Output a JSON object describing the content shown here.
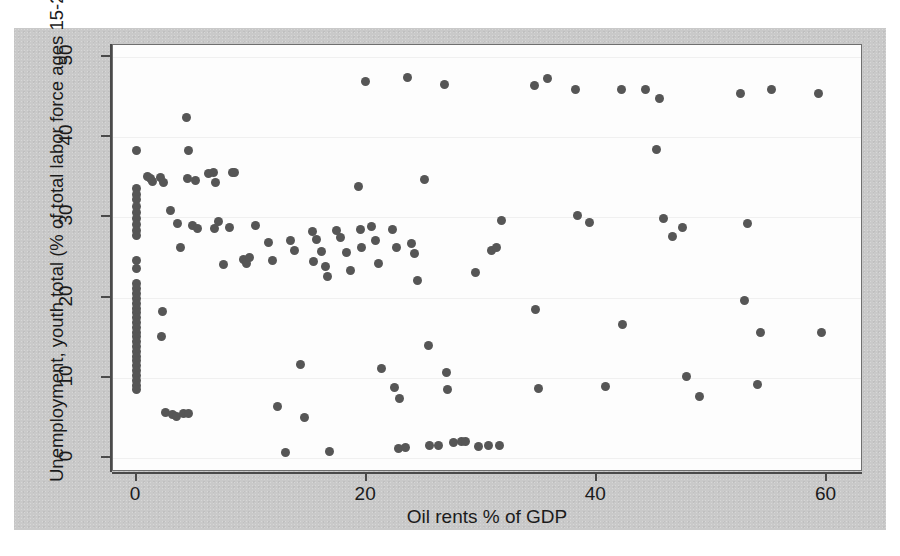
{
  "figure": {
    "background_color": "#c9c9c9",
    "plot_background_color": "#fdfdfd",
    "marker_color": "#565656"
  },
  "chart_data": {
    "type": "scatter",
    "title": "",
    "xlabel": "Oil rents % of GDP",
    "ylabel": "Unemployment, youth total (% of total labor force ages 15-24)",
    "xlim": [
      -2,
      63
    ],
    "ylim": [
      -1.5,
      51.5
    ],
    "xticks": [
      0,
      20,
      40,
      60
    ],
    "yticks": [
      0,
      10,
      20,
      30,
      40,
      50
    ],
    "xtick_labels": [
      "0",
      "20",
      "40",
      "60"
    ],
    "ytick_labels": [
      "0",
      "10",
      "20",
      "30",
      "40",
      "50"
    ],
    "grid": "faint horizontal",
    "legend": "none",
    "marker": "filled circle",
    "points": [
      [
        0.0,
        38.4
      ],
      [
        0.0,
        33.6
      ],
      [
        0.0,
        32.9
      ],
      [
        0.0,
        32.2
      ],
      [
        0.0,
        31.4
      ],
      [
        0.0,
        30.6
      ],
      [
        0.0,
        29.9
      ],
      [
        0.0,
        29.1
      ],
      [
        0.0,
        28.4
      ],
      [
        0.0,
        27.8
      ],
      [
        0.0,
        24.6
      ],
      [
        0.0,
        23.6
      ],
      [
        0.0,
        21.7
      ],
      [
        0.0,
        21.1
      ],
      [
        0.0,
        20.5
      ],
      [
        0.0,
        19.9
      ],
      [
        0.0,
        19.3
      ],
      [
        0.0,
        18.7
      ],
      [
        0.0,
        18.1
      ],
      [
        0.0,
        17.5
      ],
      [
        0.0,
        16.9
      ],
      [
        0.0,
        16.3
      ],
      [
        0.0,
        15.7
      ],
      [
        0.0,
        15.1
      ],
      [
        0.0,
        14.5
      ],
      [
        0.0,
        13.9
      ],
      [
        0.0,
        13.3
      ],
      [
        0.0,
        12.7
      ],
      [
        0.0,
        12.1
      ],
      [
        0.0,
        11.5
      ],
      [
        0.0,
        10.9
      ],
      [
        0.0,
        10.3
      ],
      [
        0.0,
        9.7
      ],
      [
        0.0,
        9.1
      ],
      [
        0.0,
        8.6
      ],
      [
        1.0,
        35.1
      ],
      [
        1.3,
        34.8
      ],
      [
        1.4,
        34.5
      ],
      [
        2.1,
        35.0
      ],
      [
        2.4,
        34.4
      ],
      [
        2.3,
        18.3
      ],
      [
        2.2,
        15.1
      ],
      [
        2.6,
        5.7
      ],
      [
        3.2,
        5.4
      ],
      [
        3.5,
        5.2
      ],
      [
        4.1,
        5.5
      ],
      [
        4.6,
        5.5
      ],
      [
        3.0,
        30.9
      ],
      [
        3.6,
        29.3
      ],
      [
        3.9,
        26.2
      ],
      [
        4.4,
        42.5
      ],
      [
        4.6,
        38.4
      ],
      [
        4.5,
        34.9
      ],
      [
        5.2,
        34.6
      ],
      [
        4.9,
        29.0
      ],
      [
        5.3,
        28.6
      ],
      [
        6.3,
        35.5
      ],
      [
        6.7,
        35.6
      ],
      [
        6.9,
        34.3
      ],
      [
        6.8,
        28.6
      ],
      [
        7.2,
        29.5
      ],
      [
        7.6,
        24.1
      ],
      [
        8.4,
        35.6
      ],
      [
        8.6,
        35.6
      ],
      [
        8.1,
        28.7
      ],
      [
        9.3,
        24.8
      ],
      [
        9.6,
        24.3
      ],
      [
        9.9,
        25.0
      ],
      [
        10.4,
        29.0
      ],
      [
        11.5,
        26.9
      ],
      [
        11.9,
        24.6
      ],
      [
        12.3,
        6.4
      ],
      [
        13.0,
        0.7
      ],
      [
        13.4,
        27.1
      ],
      [
        13.8,
        25.9
      ],
      [
        14.3,
        11.7
      ],
      [
        14.6,
        5.1
      ],
      [
        15.3,
        28.3
      ],
      [
        15.7,
        27.2
      ],
      [
        15.4,
        24.5
      ],
      [
        16.1,
        25.8
      ],
      [
        16.5,
        23.9
      ],
      [
        16.6,
        22.6
      ],
      [
        16.8,
        0.8
      ],
      [
        17.4,
        28.4
      ],
      [
        17.8,
        27.5
      ],
      [
        18.3,
        25.6
      ],
      [
        18.6,
        23.4
      ],
      [
        19.3,
        33.8
      ],
      [
        19.5,
        28.5
      ],
      [
        19.6,
        26.3
      ],
      [
        19.9,
        47.0
      ],
      [
        20.5,
        28.9
      ],
      [
        20.8,
        27.1
      ],
      [
        21.1,
        24.3
      ],
      [
        21.3,
        11.2
      ],
      [
        22.3,
        28.5
      ],
      [
        22.6,
        26.3
      ],
      [
        22.5,
        8.8
      ],
      [
        22.9,
        7.4
      ],
      [
        22.8,
        1.2
      ],
      [
        23.4,
        1.3
      ],
      [
        23.6,
        47.5
      ],
      [
        23.9,
        26.7
      ],
      [
        24.2,
        25.5
      ],
      [
        24.5,
        22.1
      ],
      [
        25.1,
        34.7
      ],
      [
        25.4,
        14.0
      ],
      [
        25.5,
        1.5
      ],
      [
        26.3,
        1.5
      ],
      [
        26.8,
        46.6
      ],
      [
        27.0,
        10.6
      ],
      [
        27.1,
        8.6
      ],
      [
        27.6,
        1.9
      ],
      [
        28.3,
        2.0
      ],
      [
        28.6,
        2.0
      ],
      [
        29.5,
        23.1
      ],
      [
        29.8,
        1.4
      ],
      [
        30.6,
        1.5
      ],
      [
        30.9,
        25.9
      ],
      [
        31.3,
        26.2
      ],
      [
        31.6,
        1.5
      ],
      [
        31.8,
        29.6
      ],
      [
        34.6,
        46.4
      ],
      [
        34.7,
        18.5
      ],
      [
        35.0,
        8.7
      ],
      [
        35.8,
        47.3
      ],
      [
        38.2,
        46.0
      ],
      [
        38.4,
        30.3
      ],
      [
        39.4,
        29.4
      ],
      [
        40.8,
        8.9
      ],
      [
        42.2,
        45.9
      ],
      [
        42.3,
        16.6
      ],
      [
        44.3,
        45.9
      ],
      [
        45.2,
        38.5
      ],
      [
        45.5,
        44.8
      ],
      [
        45.8,
        29.9
      ],
      [
        46.6,
        27.6
      ],
      [
        47.5,
        28.7
      ],
      [
        47.8,
        10.2
      ],
      [
        49.0,
        7.7
      ],
      [
        52.5,
        45.5
      ],
      [
        53.1,
        29.3
      ],
      [
        52.9,
        19.6
      ],
      [
        54.3,
        15.6
      ],
      [
        55.2,
        46.0
      ],
      [
        54.0,
        9.2
      ],
      [
        59.3,
        45.5
      ],
      [
        59.6,
        15.6
      ]
    ]
  }
}
